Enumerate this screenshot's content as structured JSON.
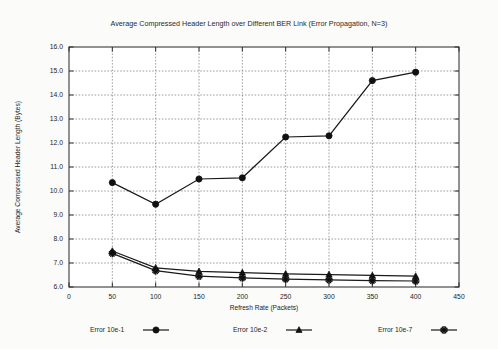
{
  "chart_data": {
    "type": "line",
    "title": "Average Compressed Header Length over Different BER Link (Error Propagation, N=3)",
    "xlabel": "Refresh Rate (Packets)",
    "ylabel": "Average Compressed Header Length (Bytes)",
    "xlim": [
      0,
      450
    ],
    "ylim": [
      6.0,
      16.0
    ],
    "xticks": [
      0,
      50,
      100,
      150,
      200,
      250,
      300,
      350,
      400,
      450
    ],
    "xtick_labels": [
      "0",
      "50",
      "100",
      "150",
      "200",
      "250",
      "300",
      "350",
      "400",
      "450"
    ],
    "yticks": [
      6.0,
      7.0,
      8.0,
      9.0,
      10.0,
      11.0,
      12.0,
      13.0,
      14.0,
      15.0,
      16.0
    ],
    "ytick_labels": [
      "6.0",
      "7.0",
      "8.0",
      "9.0",
      "10.0",
      "11.0",
      "12.0",
      "13.0",
      "14.0",
      "15.0",
      "16.0"
    ],
    "grid": true,
    "legend_position": "below",
    "x": [
      50,
      100,
      150,
      200,
      250,
      300,
      350,
      400
    ],
    "series": [
      {
        "name": "Error 10e-1",
        "marker": "filled-circle",
        "values": [
          10.35,
          9.45,
          10.5,
          10.55,
          12.25,
          12.3,
          14.6,
          14.95
        ]
      },
      {
        "name": "Error 10e-2",
        "marker": "triangle",
        "values": [
          7.5,
          6.8,
          6.65,
          6.6,
          6.55,
          6.52,
          6.48,
          6.45
        ]
      },
      {
        "name": "Error 10e-7",
        "marker": "asterisk",
        "values": [
          7.4,
          6.68,
          6.45,
          6.38,
          6.33,
          6.3,
          6.27,
          6.25
        ]
      }
    ]
  },
  "legend": {
    "items": [
      {
        "label": "Error 10e-1",
        "marker": "filled-circle"
      },
      {
        "label": "Error 10e-2",
        "marker": "triangle"
      },
      {
        "label": "Error 10e-7",
        "marker": "asterisk"
      }
    ]
  }
}
